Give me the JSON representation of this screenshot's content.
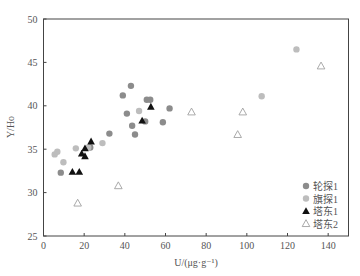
{
  "chart_data": {
    "type": "scatter",
    "title": "",
    "xlabel": "U/(μg·g⁻¹)",
    "ylabel": "Y/Ho",
    "xlim": [
      0,
      150
    ],
    "ylim": [
      25,
      50
    ],
    "x_ticks": [
      0,
      20,
      40,
      60,
      80,
      100,
      120,
      140
    ],
    "y_ticks": [
      25,
      30,
      35,
      40,
      45,
      50
    ],
    "grid": false,
    "legend_position": "lower right",
    "series": [
      {
        "name": "轮探1",
        "marker": "circle-filled",
        "color": "#8c8c8c",
        "points": [
          [
            43,
            42.3
          ],
          [
            39,
            41.2
          ],
          [
            50.8,
            40.7
          ],
          [
            52.5,
            40.7
          ],
          [
            62,
            39.7
          ],
          [
            41,
            39.1
          ],
          [
            50,
            38.2
          ],
          [
            58.7,
            38.1
          ],
          [
            43.6,
            37.7
          ],
          [
            45,
            36.7
          ],
          [
            32.4,
            36.8
          ],
          [
            23,
            35.2
          ],
          [
            8.5,
            32.3
          ]
        ]
      },
      {
        "name": "旗探1",
        "marker": "circle-filled",
        "color": "#bdbdbd",
        "points": [
          [
            124.4,
            46.5
          ],
          [
            107.3,
            41.1
          ],
          [
            47,
            39.4
          ],
          [
            29,
            35.7
          ],
          [
            22,
            35.2
          ],
          [
            15.9,
            35.1
          ],
          [
            6.8,
            34.7
          ],
          [
            5.5,
            34.4
          ],
          [
            9.8,
            33.5
          ]
        ]
      },
      {
        "name": "塔东1",
        "marker": "triangle-filled",
        "color": "#111111",
        "points": [
          [
            52.8,
            39.9
          ],
          [
            48.5,
            38.3
          ],
          [
            23.4,
            35.9
          ],
          [
            20.4,
            35.1
          ],
          [
            18.8,
            34.5
          ],
          [
            20.4,
            34.2
          ],
          [
            14.2,
            32.4
          ],
          [
            17.6,
            32.4
          ]
        ]
      },
      {
        "name": "塔东2",
        "marker": "triangle-open",
        "color": "#a0a0a0",
        "points": [
          [
            136.5,
            44.6
          ],
          [
            72.8,
            39.3
          ],
          [
            98,
            39.3
          ],
          [
            95.5,
            36.7
          ],
          [
            36.8,
            30.8
          ],
          [
            16.8,
            28.8
          ]
        ]
      }
    ]
  }
}
